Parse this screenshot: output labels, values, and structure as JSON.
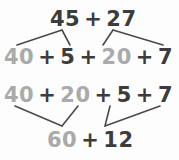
{
  "diagram": {
    "colors": {
      "dark_text": "#3c3c3c",
      "gray_text": "#aaaaaa",
      "line": "#4a4a4a",
      "background": "#fdfdfd"
    },
    "rows": {
      "top": {
        "addend_1": "45",
        "operator_1": "+",
        "addend_2": "27"
      },
      "split": {
        "tens_1": "40",
        "operator_1": "+",
        "ones_1": "5",
        "operator_2": "+",
        "tens_2": "20",
        "operator_3": "+",
        "ones_2": "7"
      },
      "regroup": {
        "tens_1": "40",
        "operator_1": "+",
        "tens_2": "20",
        "operator_2": "+",
        "ones_1": "5",
        "operator_3": "+",
        "ones_2": "7"
      },
      "sums": {
        "tens_sum": "60",
        "operator_1": "+",
        "ones_sum": "12"
      }
    }
  }
}
